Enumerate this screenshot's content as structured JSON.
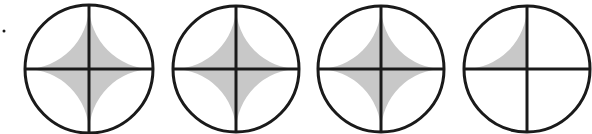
{
  "diagram": {
    "type": "fraction-circles",
    "fill_color": "#c8c8c8",
    "stroke_color": "#1a1a1a",
    "background": "#ffffff",
    "stray_dot": {
      "x": 4,
      "y": 31
    },
    "circles": [
      {
        "cx": 89,
        "cy": 69,
        "r": 64,
        "parts": 4,
        "shaded": [
          true,
          true,
          true,
          true
        ]
      },
      {
        "cx": 236,
        "cy": 69,
        "r": 63,
        "parts": 4,
        "shaded": [
          true,
          true,
          true,
          true
        ]
      },
      {
        "cx": 381,
        "cy": 69,
        "r": 63,
        "parts": 4,
        "shaded": [
          true,
          true,
          true,
          true
        ]
      },
      {
        "cx": 527,
        "cy": 69,
        "r": 63,
        "parts": 4,
        "shaded": [
          true,
          false,
          false,
          false
        ]
      }
    ]
  }
}
